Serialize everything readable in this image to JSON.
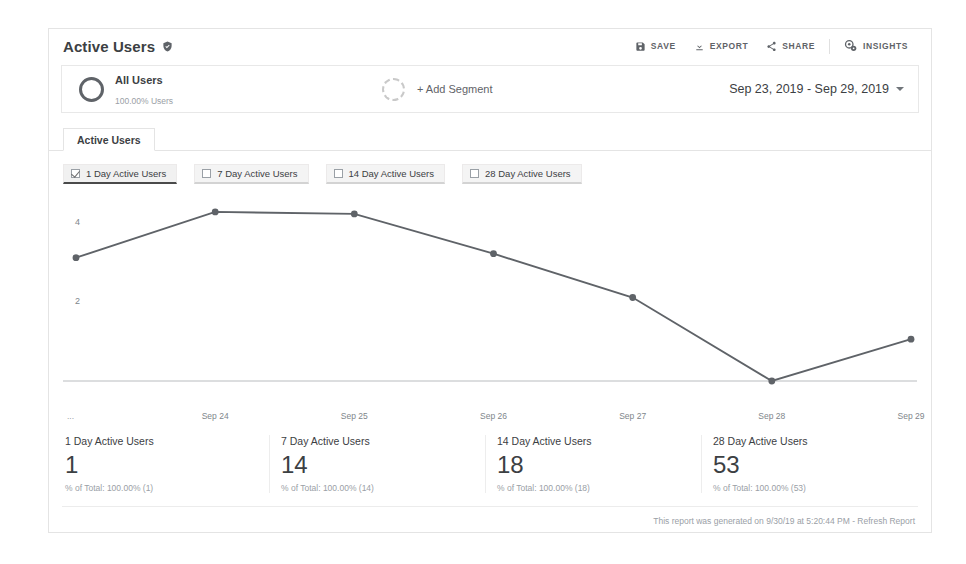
{
  "header": {
    "title": "Active Users",
    "verified_icon": "verified-shield-icon",
    "toolbar": [
      {
        "label": "SAVE",
        "icon": "save-disk-icon"
      },
      {
        "label": "EXPORT",
        "icon": "export-download-icon"
      },
      {
        "label": "SHARE",
        "icon": "share-nodes-icon"
      },
      {
        "label": "INSIGHTS",
        "icon": "insights-gear-icon"
      }
    ]
  },
  "segments": {
    "applied": {
      "name": "All Users",
      "sublabel": "100.00% Users",
      "ring_icon": "segment-ring-icon"
    },
    "add": {
      "label": "+ Add Segment",
      "ring_icon": "segment-ring-dashed-icon"
    }
  },
  "date_range": {
    "label": "Sep 23, 2019 - Sep 29, 2019",
    "caret_icon": "chevron-down-icon"
  },
  "tabs": [
    {
      "label": "Active Users",
      "selected": true
    }
  ],
  "metric_chips": [
    {
      "label": "1 Day Active Users",
      "checked": true
    },
    {
      "label": "7 Day Active Users",
      "checked": false
    },
    {
      "label": "14 Day Active Users",
      "checked": false
    },
    {
      "label": "28 Day Active Users",
      "checked": false
    }
  ],
  "summary": [
    {
      "name": "1 Day Active Users",
      "value": "1",
      "pct": "% of Total: 100.00% (1)"
    },
    {
      "name": "7 Day Active Users",
      "value": "14",
      "pct": "% of Total: 100.00% (14)"
    },
    {
      "name": "14 Day Active Users",
      "value": "18",
      "pct": "% of Total: 100.00% (18)"
    },
    {
      "name": "28 Day Active Users",
      "value": "53",
      "pct": "% of Total: 100.00% (53)"
    }
  ],
  "footer": {
    "text": "This report was generated on 9/30/19 at 5:20:44 PM - ",
    "refresh_label": "Refresh Report"
  },
  "colors": {
    "line": "#5f6368",
    "text_primary": "#3c4043",
    "text_muted": "#9aa0a6",
    "chip_bg": "#f4f4f4",
    "card_border": "#e4e4e4"
  },
  "chart_data": {
    "type": "line",
    "title": "Active Users",
    "xlabel": "",
    "ylabel": "",
    "x": [
      "Sep 23",
      "Sep 24",
      "Sep 25",
      "Sep 26",
      "Sep 27",
      "Sep 28",
      "Sep 29"
    ],
    "x_tick_labels": [
      "Sep 24",
      "Sep 25",
      "Sep 26",
      "Sep 27",
      "Sep 28",
      "Sep 29"
    ],
    "y_ticks": [
      2,
      4
    ],
    "ylim": [
      0,
      4.6
    ],
    "grid": false,
    "legend_position": "none",
    "series": [
      {
        "name": "1 Day Active Users",
        "values": [
          3.1,
          4.25,
          4.2,
          3.2,
          2.1,
          0,
          1.05
        ]
      }
    ]
  }
}
